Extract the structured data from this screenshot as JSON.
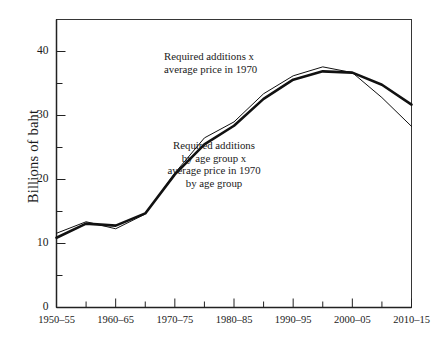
{
  "chart_data": {
    "type": "line",
    "title": "",
    "xlabel": "",
    "ylabel": "Billions of baht",
    "ylim": [
      0,
      45
    ],
    "yticks_major": [
      0,
      10,
      20,
      30,
      40
    ],
    "yticks_minor": [
      5,
      15,
      25,
      35
    ],
    "ytick_labels": [
      "0",
      "10",
      "20",
      "30",
      "40"
    ],
    "grid": false,
    "legend_position": "inline-annotations",
    "x": [
      "1950-55",
      "1955-60",
      "1960-65",
      "1965-70",
      "1970-75",
      "1975-80",
      "1980-85",
      "1985-90",
      "1990-95",
      "1995-2000",
      "2000-05",
      "2005-10",
      "2010-15"
    ],
    "xtick_labels": [
      "1950–55",
      "1960–65",
      "1970–75",
      "1980–85",
      "1990–95",
      "2000–05",
      "2010–15"
    ],
    "xtick_label_positions": [
      0,
      2,
      4,
      6,
      8,
      10,
      12
    ],
    "series": [
      {
        "name": "Required additions x average price in 1970",
        "style": "thin",
        "values": [
          11.6,
          13.4,
          12.3,
          14.6,
          21.0,
          26.5,
          29.0,
          33.4,
          36.2,
          37.6,
          36.7,
          32.8,
          28.3
        ]
      },
      {
        "name": "Required additions by age group x average price in 1970 by age group",
        "style": "thick",
        "values": [
          10.9,
          13.1,
          12.8,
          14.7,
          20.8,
          25.5,
          28.4,
          32.6,
          35.6,
          36.9,
          36.7,
          34.8,
          31.7
        ]
      }
    ],
    "annotations": [
      {
        "id": "annotation-thin-series",
        "lines": [
          "Required additions x",
          "average price in 1970"
        ],
        "align": "left",
        "x": 164,
        "y": 50
      },
      {
        "id": "annotation-thick-series",
        "lines": [
          "Required additions",
          "by age group x",
          "average price in 1970",
          "by age group"
        ],
        "align": "center",
        "x": 214,
        "y": 139
      }
    ],
    "colors": {
      "line": "#111111",
      "axis": "#222222",
      "background": "#ffffff"
    }
  }
}
